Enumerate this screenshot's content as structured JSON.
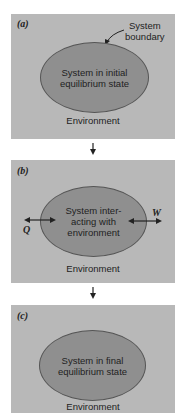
{
  "figure": {
    "panels": [
      {
        "id": "a",
        "label": "(a)",
        "system_text": "System in initial\nequilibrium state",
        "environment": "Environment",
        "annotation": "System\nboundary"
      },
      {
        "id": "b",
        "label": "(b)",
        "system_text": "System inter-\nacting with\nenvironment",
        "environment": "Environment",
        "heat_label": "Q",
        "work_label": "W"
      },
      {
        "id": "c",
        "label": "(c)",
        "system_text": "System in final\nequilibrium state",
        "environment": "Environment"
      }
    ],
    "colors": {
      "panel_background": "#b8b8b8",
      "system_fill": "#8f8f8f",
      "text": "#222222"
    }
  }
}
